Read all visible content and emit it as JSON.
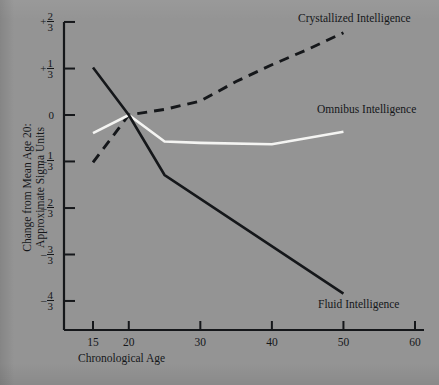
{
  "chart_data": {
    "type": "line",
    "title": "",
    "xlabel": "Chronological Age",
    "ylabel_line1": "Change from Mean Age 20:",
    "ylabel_line2": "Approximate Sigma Units",
    "x_ticks": [
      15,
      20,
      30,
      40,
      50,
      60
    ],
    "x_tick_labels": [
      "15",
      "20",
      "30",
      "40",
      "50",
      "60"
    ],
    "xlim": [
      13,
      60
    ],
    "y_ticks": [
      0.667,
      0.333,
      0,
      -0.333,
      -0.667,
      -1.0,
      -1.333
    ],
    "y_tick_labels": [
      {
        "sign": "+",
        "num": "2",
        "den": "3"
      },
      {
        "sign": "+",
        "num": "1",
        "den": "3"
      },
      {
        "sign": "",
        "num": "0",
        "den": ""
      },
      {
        "sign": "–",
        "num": "1",
        "den": "3"
      },
      {
        "sign": "–",
        "num": "2",
        "den": "3"
      },
      {
        "sign": "–",
        "num": "3",
        "den": "3"
      },
      {
        "sign": "–",
        "num": "4",
        "den": "3"
      }
    ],
    "ylim": [
      -1.45,
      0.72
    ],
    "grid": false,
    "legend_position": "inline-annotations",
    "series": [
      {
        "name": "Crystallized Intelligence",
        "style": "dashed",
        "color": "#15171a",
        "x": [
          15,
          20,
          25,
          30,
          35,
          40,
          45,
          50
        ],
        "y": [
          -0.34,
          0.0,
          0.04,
          0.1,
          0.24,
          0.36,
          0.47,
          0.59
        ]
      },
      {
        "name": "Omnibus Intelligence",
        "style": "solid",
        "color": "#f4f4f2",
        "x": [
          15,
          20,
          25,
          30,
          40,
          50
        ],
        "y": [
          -0.13,
          0.0,
          -0.19,
          -0.2,
          -0.21,
          -0.12
        ]
      },
      {
        "name": "Fluid Intelligence",
        "style": "solid",
        "color": "#15171a",
        "x": [
          15,
          20,
          25,
          50
        ],
        "y": [
          0.34,
          0.0,
          -0.43,
          -1.28
        ]
      }
    ],
    "annotations": [
      {
        "text": "Crystallized Intelligence",
        "series": "Crystallized Intelligence"
      },
      {
        "text": "Omnibus Intelligence",
        "series": "Omnibus Intelligence"
      },
      {
        "text": "Fluid Intelligence",
        "series": "Fluid Intelligence"
      }
    ],
    "colors": {
      "background": "#949494",
      "axis": "#15171a",
      "text": "#15171a",
      "crystallized": "#15171a",
      "omnibus": "#f4f4f2",
      "fluid": "#15171a"
    }
  }
}
